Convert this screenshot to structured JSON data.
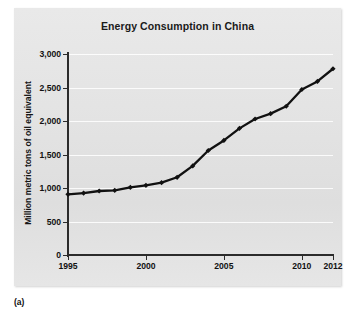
{
  "figure": {
    "caption": "(a)",
    "panel_color": "#e4e4e4",
    "line_color": "#111111",
    "grid_color": "#ffffff"
  },
  "chart_data": {
    "type": "line",
    "title": "Energy Consumption in China",
    "xlabel": "",
    "ylabel": "Million metric tons of oil equivalent",
    "xlim": [
      1995,
      2012
    ],
    "ylim": [
      0,
      3000
    ],
    "grid": true,
    "legend": "none",
    "marker": "diamond",
    "x_tick_labels": [
      "1995",
      "2000",
      "2005",
      "2010",
      "2012"
    ],
    "x_tick_values": [
      1995,
      2000,
      2005,
      2010,
      2012
    ],
    "y_tick_labels": [
      "0",
      "500",
      "1,000",
      "1,500",
      "2,000",
      "2,500",
      "3,000"
    ],
    "y_tick_values": [
      0,
      500,
      1000,
      1500,
      2000,
      2500,
      3000
    ],
    "x": [
      1995,
      1996,
      1997,
      1998,
      1999,
      2000,
      2001,
      2002,
      2003,
      2004,
      2005,
      2006,
      2007,
      2008,
      2009,
      2010,
      2011,
      2012
    ],
    "values": [
      905,
      925,
      955,
      965,
      1010,
      1040,
      1080,
      1160,
      1330,
      1560,
      1710,
      1890,
      2030,
      2110,
      2220,
      2470,
      2590,
      2780
    ],
    "series": [
      {
        "name": "Energy consumption",
        "values": [
          905,
          925,
          955,
          965,
          1010,
          1040,
          1080,
          1160,
          1330,
          1560,
          1710,
          1890,
          2030,
          2110,
          2220,
          2470,
          2590,
          2780
        ]
      }
    ]
  }
}
